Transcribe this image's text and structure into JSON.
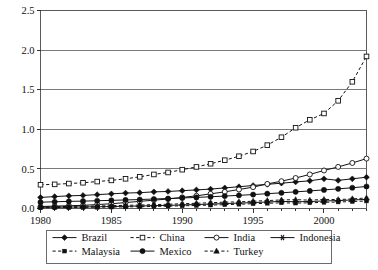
{
  "chart_data": {
    "type": "line",
    "title": "",
    "subtitle": "",
    "xlabel": "",
    "ylabel": "",
    "xlim": [
      1980,
      2003
    ],
    "ylim": [
      0.0,
      2.5
    ],
    "grid": true,
    "legend_position": "bottom",
    "y_ticks": [
      "0.0",
      "0.5",
      "1.0",
      "1.5",
      "2.0",
      "2.5"
    ],
    "y_tick_values": [
      0.0,
      0.5,
      1.0,
      1.5,
      2.0,
      2.5
    ],
    "x_ticks": [
      "1980",
      "1985",
      "1990",
      "1995",
      "2000"
    ],
    "x_tick_values": [
      1980,
      1985,
      1990,
      1995,
      2000
    ],
    "x": [
      1980,
      1981,
      1982,
      1983,
      1984,
      1985,
      1986,
      1987,
      1988,
      1989,
      1990,
      1991,
      1992,
      1993,
      1994,
      1995,
      1996,
      1997,
      1998,
      1999,
      2000,
      2001,
      2002,
      2003
    ],
    "series": [
      {
        "name": "Brazil",
        "marker": "filled-diamond",
        "linestyle": "solid",
        "color": "#111111",
        "values": [
          0.14,
          0.15,
          0.16,
          0.165,
          0.175,
          0.185,
          0.195,
          0.2,
          0.21,
          0.215,
          0.225,
          0.235,
          0.245,
          0.26,
          0.275,
          0.29,
          0.305,
          0.32,
          0.335,
          0.35,
          0.375,
          0.355,
          0.375,
          0.395
        ]
      },
      {
        "name": "China",
        "marker": "open-square",
        "linestyle": "dashed",
        "color": "#111111",
        "values": [
          0.3,
          0.305,
          0.315,
          0.325,
          0.34,
          0.355,
          0.375,
          0.4,
          0.43,
          0.455,
          0.49,
          0.525,
          0.565,
          0.61,
          0.66,
          0.72,
          0.8,
          0.9,
          1.02,
          1.12,
          1.2,
          1.36,
          1.6,
          1.92
        ]
      },
      {
        "name": "India",
        "marker": "open-circle",
        "linestyle": "solid",
        "color": "#111111",
        "values": [
          0.025,
          0.03,
          0.035,
          0.04,
          0.05,
          0.06,
          0.075,
          0.09,
          0.105,
          0.12,
          0.14,
          0.16,
          0.185,
          0.21,
          0.24,
          0.27,
          0.31,
          0.345,
          0.385,
          0.43,
          0.48,
          0.525,
          0.575,
          0.63
        ]
      },
      {
        "name": "Indonesia",
        "marker": "star",
        "linestyle": "solid",
        "color": "#111111",
        "values": [
          0.015,
          0.016,
          0.018,
          0.02,
          0.022,
          0.025,
          0.028,
          0.032,
          0.036,
          0.04,
          0.045,
          0.05,
          0.056,
          0.062,
          0.068,
          0.075,
          0.082,
          0.09,
          0.085,
          0.088,
          0.095,
          0.1,
          0.108,
          0.115
        ]
      },
      {
        "name": "Malaysia",
        "marker": "small-filled-square",
        "linestyle": "dashed",
        "color": "#111111",
        "values": [
          0.01,
          0.011,
          0.012,
          0.014,
          0.016,
          0.018,
          0.02,
          0.023,
          0.026,
          0.03,
          0.034,
          0.038,
          0.043,
          0.048,
          0.054,
          0.06,
          0.066,
          0.072,
          0.068,
          0.072,
          0.078,
          0.082,
          0.088,
          0.095
        ]
      },
      {
        "name": "Mexico",
        "marker": "filled-circle",
        "linestyle": "solid",
        "color": "#111111",
        "values": [
          0.08,
          0.085,
          0.09,
          0.093,
          0.098,
          0.103,
          0.108,
          0.113,
          0.12,
          0.126,
          0.133,
          0.14,
          0.148,
          0.157,
          0.166,
          0.176,
          0.187,
          0.198,
          0.21,
          0.222,
          0.235,
          0.248,
          0.262,
          0.278
        ]
      },
      {
        "name": "Turkey",
        "marker": "filled-triangle",
        "linestyle": "dashed",
        "color": "#111111",
        "values": [
          0.022,
          0.024,
          0.026,
          0.029,
          0.032,
          0.036,
          0.04,
          0.044,
          0.049,
          0.054,
          0.06,
          0.066,
          0.073,
          0.08,
          0.084,
          0.092,
          0.1,
          0.108,
          0.112,
          0.105,
          0.115,
          0.112,
          0.122,
          0.132
        ]
      }
    ],
    "legend": [
      {
        "label": "Brazil",
        "marker": "filled-diamond",
        "linestyle": "solid"
      },
      {
        "label": "China",
        "marker": "open-square",
        "linestyle": "dashed"
      },
      {
        "label": "India",
        "marker": "open-circle",
        "linestyle": "solid"
      },
      {
        "label": "Indonesia",
        "marker": "star",
        "linestyle": "solid"
      },
      {
        "label": "Malaysia",
        "marker": "small-filled-square",
        "linestyle": "dashed"
      },
      {
        "label": "Mexico",
        "marker": "filled-circle",
        "linestyle": "solid"
      },
      {
        "label": "Turkey",
        "marker": "filled-triangle",
        "linestyle": "dashed"
      }
    ]
  },
  "colors": {
    "ink": "#111111",
    "grid": "#7a7a7a",
    "border": "#5a5a5a",
    "background": "#ffffff"
  }
}
